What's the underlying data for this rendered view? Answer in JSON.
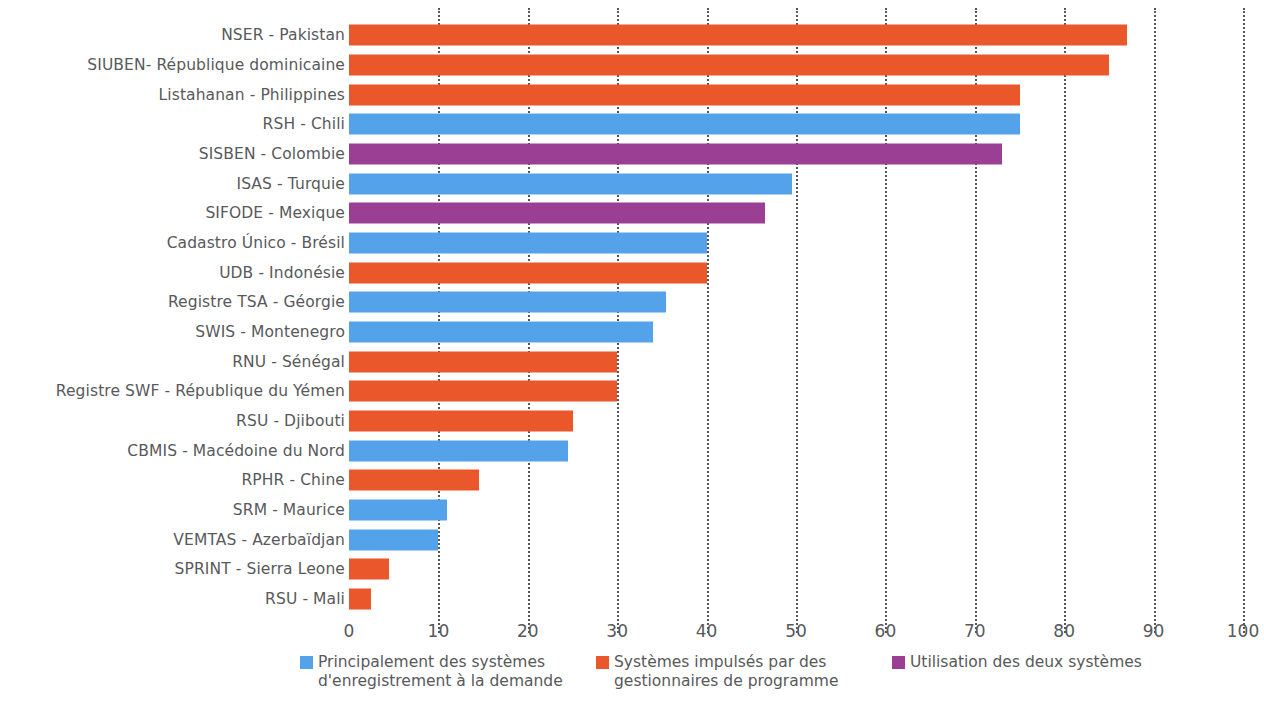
{
  "chart_data": {
    "type": "bar",
    "orientation": "horizontal",
    "title": "",
    "xlabel": "",
    "ylabel": "",
    "xlim": [
      0,
      100
    ],
    "xticks": [
      "0",
      "10",
      "20",
      "30",
      "40",
      "50",
      "60",
      "70",
      "80",
      "90",
      "100"
    ],
    "grid": "vertical-dotted",
    "legend_position": "bottom",
    "categories": [
      "NSER - Pakistan",
      "SIUBEN- République dominicaine",
      "Listahanan - Philippines",
      "RSH - Chili",
      "SISBEN - Colombie",
      "ISAS - Turquie",
      "SIFODE - Mexique",
      "Cadastro Único - Brésil",
      "UDB - Indonésie",
      "Registre TSA - Géorgie",
      "SWIS - Montenegro",
      "RNU - Sénégal",
      "Registre SWF - République du Yémen",
      "RSU - Djibouti",
      "CBMIS - Macédoine du Nord",
      "RPHR - Chine",
      "SRM - Maurice",
      "VEMTAS - Azerbaïdjan",
      "SPRINT - Sierra Leone",
      "RSU - Mali"
    ],
    "values": [
      87,
      85,
      75,
      75,
      73,
      49.5,
      46.5,
      40,
      40,
      35.5,
      34,
      30,
      30,
      25,
      24.5,
      14.5,
      11,
      10,
      4.5,
      2.5
    ],
    "groups": [
      "program-driven",
      "program-driven",
      "program-driven",
      "on-demand",
      "both",
      "on-demand",
      "both",
      "on-demand",
      "program-driven",
      "on-demand",
      "on-demand",
      "program-driven",
      "program-driven",
      "program-driven",
      "on-demand",
      "program-driven",
      "on-demand",
      "on-demand",
      "program-driven",
      "program-driven"
    ],
    "legend": [
      {
        "key": "on-demand",
        "label": "Principalement des systèmes d'enregistrement à la demande",
        "color": "#54A3EA"
      },
      {
        "key": "program-driven",
        "label": "Systèmes impulsés par des gestionnaires de programme",
        "color": "#E9572B"
      },
      {
        "key": "both",
        "label": "Utilisation des deux systèmes",
        "color": "#9B3F94"
      }
    ],
    "colors": {
      "on-demand": "#54A3EA",
      "program-driven": "#E9572B",
      "both": "#9B3F94",
      "text": "#58595b",
      "gridline": "#4d4d4d"
    }
  }
}
